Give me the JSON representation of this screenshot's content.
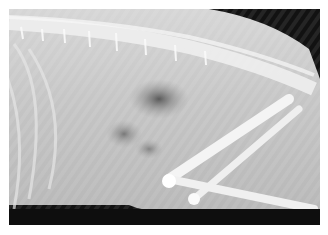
{
  "image": {
    "subject": "lateral abdominal radiograph",
    "description": "Grayscale X-ray showing spine with vertebrae along the top, abdominal cavity with gas-filled bowel loops in center, rib cage at left, hind limb bones (femur, tibia) at lower right, dark background at top right and bottom.",
    "colors": {
      "background": "#111111",
      "soft_tissue": "#c8c8c8",
      "bone": "#f4f4f4",
      "gas": "#6a6a6a",
      "border": "#ffffff"
    }
  }
}
